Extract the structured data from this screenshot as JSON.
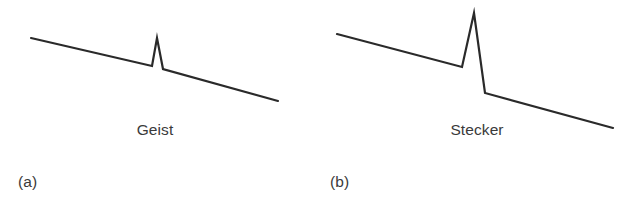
{
  "figure": {
    "background_color": "#ffffff",
    "stroke_color": "#2a2a2a",
    "text_color": "#3a3a3a",
    "width": 630,
    "height": 212
  },
  "panels": [
    {
      "id": "a",
      "panel_label": "(a)",
      "word_label": "Geist",
      "peak_type": "small",
      "path": "M 31 38 L 152 66 L 157 38 L 163 69 L 278 101"
    },
    {
      "id": "b",
      "panel_label": "(b)",
      "word_label": "Stecker",
      "peak_type": "large",
      "path": "M 22 34 L 147 67 L 159 13 L 170 93 L 298 128"
    }
  ],
  "chart_data": {
    "type": "line",
    "title": "",
    "xlabel": "",
    "ylabel": "",
    "grid": false,
    "legend": "none",
    "annotations": [
      "Geist",
      "Stecker",
      "(a)",
      "(b)"
    ],
    "series": [
      {
        "name": "Geist",
        "panel": "a",
        "description": "Falling pitch contour with a small narrow peak near the middle",
        "x": [
          31,
          152,
          157,
          163,
          278
        ],
        "y": [
          38,
          66,
          38,
          69,
          101
        ],
        "peak_height_px": 28
      },
      {
        "name": "Stecker",
        "panel": "b",
        "description": "Falling pitch contour with a large tall peak near the middle",
        "x": [
          337,
          462,
          474,
          485,
          613
        ],
        "y": [
          34,
          67,
          13,
          93,
          128
        ],
        "peak_height_px": 54
      }
    ]
  }
}
